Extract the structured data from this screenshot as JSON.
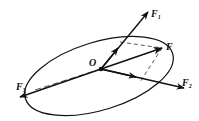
{
  "diagram": {
    "type": "force-vector-diagram",
    "origin": {
      "label": "O",
      "x": 101,
      "y": 69
    },
    "colors": {
      "stroke": "#111111",
      "background": "#ffffff"
    },
    "ellipse": {
      "cx": 99,
      "cy": 76,
      "rx": 77,
      "ry": 34,
      "rotation": -17
    },
    "vectors": [
      {
        "id": "F1",
        "label": "F",
        "subscript": "1",
        "to": [
          148,
          12
        ],
        "label_pos": [
          151,
          17
        ]
      },
      {
        "id": "F",
        "label": "F",
        "subscript": "",
        "to": [
          162,
          48
        ],
        "label_pos": [
          166,
          50
        ]
      },
      {
        "id": "F2",
        "label": "F",
        "subscript": "2",
        "to": [
          184,
          88
        ],
        "label_pos": [
          182,
          86
        ]
      },
      {
        "id": "F3",
        "label": "F",
        "subscript": "3",
        "to": [
          20,
          97
        ],
        "label_pos": [
          16,
          90
        ]
      }
    ],
    "dashed_lines": [
      {
        "from": [
          120,
          42
        ],
        "to": [
          162,
          48
        ]
      },
      {
        "from": [
          162,
          48
        ],
        "to": [
          140,
          82
        ]
      },
      {
        "from": [
          101,
          69
        ],
        "to": [
          35,
          90
        ]
      }
    ]
  }
}
